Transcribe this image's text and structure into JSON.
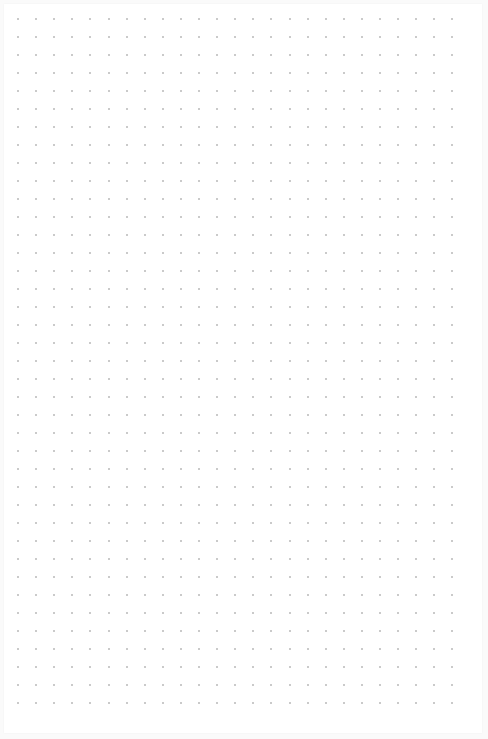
{
  "page": {
    "type": "dot-grid",
    "background": "#ffffff",
    "dot_color": "#b8b8b8",
    "grid": {
      "columns": 25,
      "rows": 39,
      "origin_x": 18,
      "origin_y": 19,
      "spacing_x": 18.1,
      "spacing_y": 18.0
    }
  }
}
